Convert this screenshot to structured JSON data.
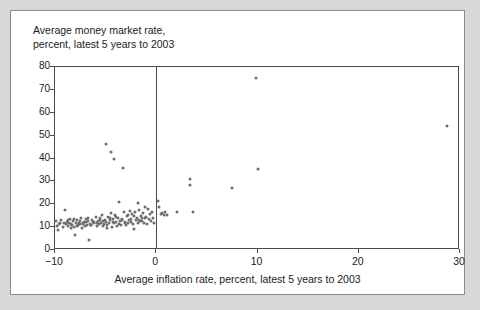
{
  "chart_data": {
    "type": "scatter",
    "title": "Average money market rate,\npercent, latest 5 years to 2003",
    "xlabel": "Average inflation rate, percent, latest 5 years to 2003",
    "ylabel": "Average money market rate, percent, latest 5 years to 2003",
    "xlim": [
      -10,
      30
    ],
    "ylim": [
      0,
      80
    ],
    "xticks": [
      -10,
      0,
      10,
      20,
      30
    ],
    "xtick_labels": [
      "−10",
      "0",
      "10",
      "20",
      "30"
    ],
    "yticks": [
      0,
      10,
      20,
      30,
      40,
      50,
      60,
      70,
      80
    ],
    "ytick_labels": [
      "0",
      "10",
      "20",
      "30",
      "40",
      "50",
      "60",
      "70",
      "80"
    ],
    "grid": false,
    "legend": null,
    "reference_line_x": 0,
    "marker_color": "#6d6d6d",
    "axis_color": "#4a4a4a",
    "background_color": "#ffffff",
    "page_background_color": "#d8d8d8",
    "points": [
      [
        -9.9,
        12.8
      ],
      [
        -9.8,
        10.4
      ],
      [
        -9.7,
        8.6
      ],
      [
        -9.6,
        11.2
      ],
      [
        -9.4,
        13.0
      ],
      [
        -9.2,
        10.0
      ],
      [
        -9.0,
        17.3
      ],
      [
        -8.9,
        11.4
      ],
      [
        -8.8,
        12.2
      ],
      [
        -8.7,
        10.6
      ],
      [
        -8.6,
        11.8
      ],
      [
        -8.5,
        13.4
      ],
      [
        -8.4,
        9.8
      ],
      [
        -8.3,
        11.0
      ],
      [
        -8.2,
        12.6
      ],
      [
        -8.1,
        10.2
      ],
      [
        -8.0,
        6.4
      ],
      [
        -7.9,
        11.6
      ],
      [
        -7.8,
        13.2
      ],
      [
        -7.7,
        10.8
      ],
      [
        -7.6,
        12.0
      ],
      [
        -7.5,
        11.3
      ],
      [
        -7.4,
        14.0
      ],
      [
        -7.3,
        9.6
      ],
      [
        -7.2,
        11.9
      ],
      [
        -7.1,
        12.4
      ],
      [
        -7.0,
        10.5
      ],
      [
        -6.9,
        13.6
      ],
      [
        -6.8,
        11.1
      ],
      [
        -6.7,
        12.8
      ],
      [
        -6.6,
        4.2
      ],
      [
        -6.5,
        11.5
      ],
      [
        -6.4,
        10.9
      ],
      [
        -6.3,
        13.0
      ],
      [
        -6.2,
        12.1
      ],
      [
        -6.1,
        11.7
      ],
      [
        -6.0,
        14.4
      ],
      [
        -5.9,
        10.3
      ],
      [
        -5.8,
        12.5
      ],
      [
        -5.7,
        11.2
      ],
      [
        -5.6,
        13.8
      ],
      [
        -5.5,
        12.0
      ],
      [
        -5.4,
        15.2
      ],
      [
        -5.3,
        10.7
      ],
      [
        -5.2,
        11.4
      ],
      [
        -5.1,
        13.1
      ],
      [
        -5.0,
        12.3
      ],
      [
        -4.95,
        46.2
      ],
      [
        -4.9,
        9.4
      ],
      [
        -4.8,
        14.6
      ],
      [
        -4.7,
        11.6
      ],
      [
        -4.6,
        12.9
      ],
      [
        -4.5,
        16.0
      ],
      [
        -4.45,
        42.8
      ],
      [
        -4.4,
        10.1
      ],
      [
        -4.3,
        13.4
      ],
      [
        -4.2,
        11.8
      ],
      [
        -4.15,
        39.6
      ],
      [
        -4.1,
        15.4
      ],
      [
        -4.0,
        12.2
      ],
      [
        -3.9,
        10.6
      ],
      [
        -3.8,
        14.0
      ],
      [
        -3.7,
        21.0
      ],
      [
        -3.6,
        12.7
      ],
      [
        -3.5,
        11.0
      ],
      [
        -3.4,
        13.6
      ],
      [
        -3.3,
        35.8
      ],
      [
        -3.2,
        16.4
      ],
      [
        -3.1,
        12.0
      ],
      [
        -3.0,
        10.8
      ],
      [
        -2.9,
        14.8
      ],
      [
        -2.8,
        11.9
      ],
      [
        -2.7,
        13.2
      ],
      [
        -2.6,
        17.0
      ],
      [
        -2.5,
        12.4
      ],
      [
        -2.4,
        15.8
      ],
      [
        -2.3,
        11.3
      ],
      [
        -2.2,
        9.2
      ],
      [
        -2.1,
        16.8
      ],
      [
        -2.0,
        13.0
      ],
      [
        -1.9,
        14.2
      ],
      [
        -1.85,
        20.6
      ],
      [
        -1.8,
        11.6
      ],
      [
        -1.7,
        17.4
      ],
      [
        -1.6,
        12.8
      ],
      [
        -1.5,
        15.0
      ],
      [
        -1.4,
        13.8
      ],
      [
        -1.3,
        16.2
      ],
      [
        -1.2,
        12.0
      ],
      [
        -1.1,
        18.8
      ],
      [
        -1.0,
        14.4
      ],
      [
        -0.9,
        11.4
      ],
      [
        -0.8,
        17.8
      ],
      [
        -0.7,
        13.4
      ],
      [
        -0.6,
        15.6
      ],
      [
        -0.5,
        12.6
      ],
      [
        -0.4,
        16.6
      ],
      [
        -0.3,
        14.0
      ],
      [
        -0.2,
        11.8
      ],
      [
        0.15,
        21.4
      ],
      [
        0.3,
        18.9
      ],
      [
        0.5,
        15.6
      ],
      [
        0.6,
        16.2
      ],
      [
        0.75,
        15.2
      ],
      [
        0.9,
        16.8
      ],
      [
        1.1,
        15.4
      ],
      [
        2.0,
        16.6
      ],
      [
        3.3,
        31.0
      ],
      [
        3.35,
        28.2
      ],
      [
        3.6,
        16.6
      ],
      [
        7.5,
        27.0
      ],
      [
        9.9,
        75.0
      ],
      [
        10.0,
        35.5
      ],
      [
        28.7,
        54.0
      ],
      [
        -9.5,
        12.0
      ],
      [
        -9.1,
        11.6
      ],
      [
        -8.75,
        12.9
      ],
      [
        -8.45,
        11.2
      ],
      [
        -8.15,
        13.5
      ],
      [
        -7.85,
        10.4
      ],
      [
        -7.55,
        12.7
      ],
      [
        -7.25,
        11.5
      ],
      [
        -6.95,
        12.2
      ],
      [
        -6.75,
        13.8
      ],
      [
        -6.45,
        10.9
      ],
      [
        -6.15,
        12.4
      ],
      [
        -5.85,
        11.7
      ],
      [
        -5.55,
        13.3
      ],
      [
        -5.25,
        12.6
      ],
      [
        -4.85,
        11.1
      ],
      [
        -4.55,
        13.9
      ],
      [
        -4.25,
        12.1
      ],
      [
        -3.95,
        14.6
      ],
      [
        -3.65,
        11.4
      ],
      [
        -3.35,
        13.0
      ],
      [
        -3.05,
        12.3
      ],
      [
        -2.75,
        15.2
      ],
      [
        -2.45,
        13.7
      ],
      [
        -2.15,
        14.9
      ],
      [
        -1.75,
        13.1
      ],
      [
        -1.45,
        12.5
      ],
      [
        -1.15,
        13.9
      ]
    ]
  }
}
